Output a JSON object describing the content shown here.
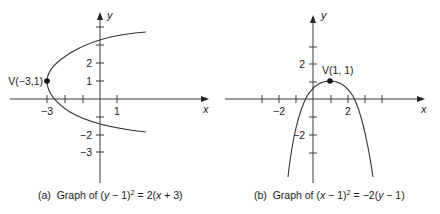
{
  "figure": {
    "panels": [
      {
        "id": "a",
        "axis_labels": {
          "x": "x",
          "y": "y"
        },
        "x_tick_labels": [
          {
            "value": -3,
            "text": "−3"
          },
          {
            "value": 1,
            "text": "1"
          }
        ],
        "y_tick_labels": [
          {
            "value": 2,
            "text": "2"
          },
          {
            "value": 1,
            "text": "1"
          },
          {
            "value": -2,
            "text": "−2"
          },
          {
            "value": -3,
            "text": "−3"
          }
        ],
        "vertex": {
          "x": -3,
          "y": 1,
          "label": "V(−3,1)"
        },
        "caption": {
          "prefix": "(a)  Graph of ",
          "equation_parts": [
            "(",
            "y",
            " − 1)",
            "2",
            " = 2(",
            "x",
            " + 3)"
          ]
        },
        "equation": "(y − 1)^2 = 2(x + 3)"
      },
      {
        "id": "b",
        "axis_labels": {
          "x": "x",
          "y": "y"
        },
        "x_tick_labels": [
          {
            "value": -2,
            "text": "−2"
          },
          {
            "value": 2,
            "text": "2"
          }
        ],
        "y_tick_labels": [
          {
            "value": 2,
            "text": "2"
          },
          {
            "value": -2,
            "text": "−2"
          }
        ],
        "vertex": {
          "x": 1,
          "y": 1,
          "label": "V(1, 1)"
        },
        "caption": {
          "prefix": "(b)  Graph of ",
          "equation_parts": [
            "(",
            "x",
            " − 1)",
            "2",
            " = −2(",
            "y",
            " − 1)"
          ]
        },
        "equation": "(x − 1)^2 = −2(y − 1)"
      }
    ]
  },
  "colors": {
    "background": "#ffffff",
    "ink": "#1a1a1a",
    "curve": "#333333"
  }
}
